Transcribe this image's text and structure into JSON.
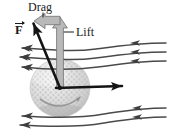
{
  "figure": {
    "kind": "physics-force-diagram",
    "width": 169,
    "height": 135,
    "background_color": "#ffffff"
  },
  "labels": {
    "drag": "Drag",
    "lift": "Lift",
    "force_symbol": "F"
  },
  "colors": {
    "ink": "#1a1a1a",
    "component_arrow": "#9a9a9a",
    "component_arrow_outline": "#6e6e6e",
    "streamline": "#4a4a4a",
    "ball_light": "#f2f2f2",
    "ball_mid": "#d8d8d8",
    "ball_shadow": "#b4b4b4",
    "dimple": "#c4c4c4"
  },
  "ball": {
    "center_x": 60,
    "center_y": 88,
    "radius_x": 30,
    "radius_y": 29,
    "dimple_rows": 9,
    "spin_arc": true
  },
  "vectors": [
    {
      "name": "resultant-force",
      "label": "F",
      "style": "black-solid",
      "from_x": 60,
      "from_y": 88,
      "to_x": 32,
      "to_y": 20
    },
    {
      "name": "lift-component",
      "label": "Lift",
      "style": "gray-outlined",
      "from_x": 60,
      "from_y": 88,
      "to_x": 60,
      "to_y": 19,
      "direction": "up"
    },
    {
      "name": "drag-component",
      "label": "Drag",
      "style": "gray-outlined",
      "from_x": 60,
      "from_y": 20,
      "to_x": 34,
      "to_y": 20,
      "direction": "left"
    },
    {
      "name": "velocity",
      "label": "",
      "style": "black-thick",
      "from_x": 60,
      "from_y": 88,
      "to_x": 126,
      "to_y": 86,
      "direction": "right"
    }
  ],
  "streamlines": {
    "flow_direction": "right-to-left",
    "above_count": 3,
    "below_count": 2,
    "arrowheads_per_line": 2
  },
  "leader_lines": [
    {
      "name": "lift-leader",
      "from_x": 74,
      "from_y": 32,
      "to_x": 62,
      "to_y": 32
    },
    {
      "name": "drag-leader",
      "from_x": 43,
      "from_y": 13,
      "to_x": 43,
      "to_y": 18
    }
  ]
}
